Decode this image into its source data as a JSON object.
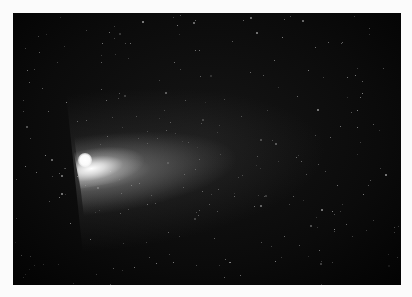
{
  "image": {
    "subject": "Comet with long diffuse tail against a dense starfield",
    "background_color": "#fbfbfb",
    "photo_bg_color": "#0b0b0b",
    "comet": {
      "nucleus_color": "#ffffff",
      "tail_direction": "right / upper-right",
      "tail_color": "#b4b4b4"
    },
    "star_color": "#d8d8d8",
    "star_count": 260
  }
}
